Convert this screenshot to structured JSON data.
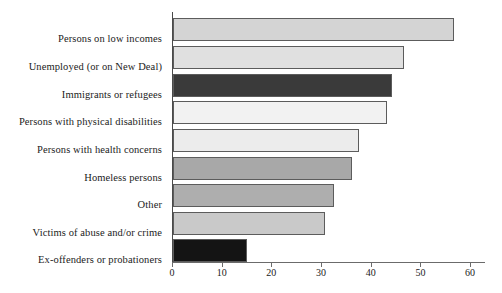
{
  "chart_data": {
    "type": "bar",
    "orientation": "horizontal",
    "title": "",
    "subtitle": "",
    "xlabel": "",
    "ylabel": "",
    "xlim": [
      0,
      63
    ],
    "grid": false,
    "legend": null,
    "xticks": [
      0,
      10,
      20,
      30,
      40,
      50,
      60
    ],
    "xtick_labels": [
      "0",
      "10",
      "20",
      "30",
      "40",
      "50",
      "60"
    ],
    "categories": [
      "Persons on low incomes",
      "Unemployed (or on New Deal)",
      "Immigrants or refugees",
      "Persons with physical disabilities",
      "Persons with health concerns",
      "Homeless persons",
      "Other",
      "Victims of abuse and/or crime",
      "Ex-offenders or probationers"
    ],
    "values": [
      56.5,
      46.5,
      44,
      43,
      37.5,
      36,
      32.5,
      30.5,
      14.8
    ],
    "bar_colors": [
      "#d4d4d4",
      "#e0e0e0",
      "#3a3a3a",
      "#f2f2f2",
      "#ececec",
      "#a8a8a8",
      "#aeaeae",
      "#c9c9c9",
      "#141414"
    ],
    "bar_edge_color": "#5c5c5c",
    "axis_color": "#6b6b6b",
    "background_color": "#ffffff"
  }
}
